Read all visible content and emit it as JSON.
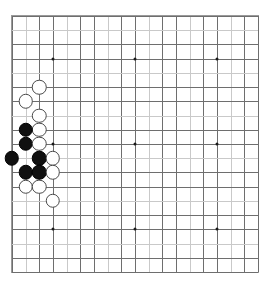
{
  "app": {
    "title": "Go Board",
    "board_label": "go-board-19x19"
  },
  "board": {
    "size": 19,
    "columns": 19,
    "rows": 19,
    "line_color": "#6e6e6e",
    "pale_line_color": "#c9c9c9",
    "border_color": "#9a9a9a",
    "background_color": "#ffffff",
    "star_point_color": "#1a1a1a",
    "black_stone_color": "#101010",
    "white_stone_color": "#ffffff",
    "white_stone_border": "#4a4a4a",
    "star_points": [
      {
        "col": 4,
        "row": 4
      },
      {
        "col": 10,
        "row": 4
      },
      {
        "col": 16,
        "row": 4
      },
      {
        "col": 4,
        "row": 10
      },
      {
        "col": 10,
        "row": 10
      },
      {
        "col": 16,
        "row": 10
      },
      {
        "col": 4,
        "row": 16
      },
      {
        "col": 10,
        "row": 16
      },
      {
        "col": 16,
        "row": 16
      }
    ],
    "stones": [
      {
        "color": "white",
        "col": 3,
        "row": 6
      },
      {
        "color": "white",
        "col": 2,
        "row": 7
      },
      {
        "color": "white",
        "col": 3,
        "row": 8
      },
      {
        "color": "white",
        "col": 3,
        "row": 9
      },
      {
        "color": "black",
        "col": 2,
        "row": 9
      },
      {
        "color": "black",
        "col": 2,
        "row": 10
      },
      {
        "color": "white",
        "col": 3,
        "row": 10
      },
      {
        "color": "black",
        "col": 1,
        "row": 11
      },
      {
        "color": "black",
        "col": 3,
        "row": 11
      },
      {
        "color": "white",
        "col": 4,
        "row": 11
      },
      {
        "color": "black",
        "col": 2,
        "row": 12
      },
      {
        "color": "black",
        "col": 3,
        "row": 12
      },
      {
        "color": "white",
        "col": 4,
        "row": 12
      },
      {
        "color": "white",
        "col": 2,
        "row": 13
      },
      {
        "color": "white",
        "col": 3,
        "row": 13
      },
      {
        "color": "white",
        "col": 4,
        "row": 14
      }
    ],
    "counts": {
      "black_stones": 6,
      "white_stones": 10,
      "total_stones": 16
    }
  }
}
